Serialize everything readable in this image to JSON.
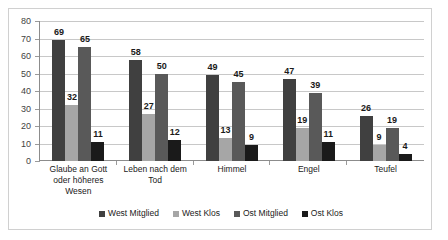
{
  "chart_data": {
    "type": "bar",
    "title": "",
    "xlabel": "",
    "ylabel": "",
    "ylim": [
      0,
      80
    ],
    "yticks": [
      0,
      10,
      20,
      30,
      40,
      50,
      60,
      70,
      80
    ],
    "grid": true,
    "legend_position": "bottom",
    "categories": [
      "Glaube an Gott oder höheres Wesen",
      "Leben nach dem Tod",
      "Himmel",
      "Engel",
      "Teufel"
    ],
    "category_lines": [
      [
        "Glaube an Gott",
        "oder höheres",
        "Wesen"
      ],
      [
        "Leben nach dem",
        "Tod"
      ],
      [
        "Himmel"
      ],
      [
        "Engel"
      ],
      [
        "Teufel"
      ]
    ],
    "series": [
      {
        "name": "West Mitglied",
        "color": "#404040",
        "values": [
          69,
          58,
          49,
          47,
          26
        ]
      },
      {
        "name": "West Klos",
        "color": "#a6a6a6",
        "values": [
          32,
          27,
          13,
          19,
          9
        ]
      },
      {
        "name": "Ost Mitglied",
        "color": "#595959",
        "values": [
          65,
          50,
          45,
          39,
          19
        ]
      },
      {
        "name": "Ost Klos",
        "color": "#1a1a1a",
        "values": [
          11,
          12,
          9,
          11,
          4
        ]
      }
    ]
  },
  "legend": {
    "items": [
      {
        "label": "West Mitglied",
        "color": "#404040"
      },
      {
        "label": "West Klos",
        "color": "#a6a6a6"
      },
      {
        "label": "Ost Mitglied",
        "color": "#595959"
      },
      {
        "label": "Ost Klos",
        "color": "#1a1a1a"
      }
    ]
  }
}
